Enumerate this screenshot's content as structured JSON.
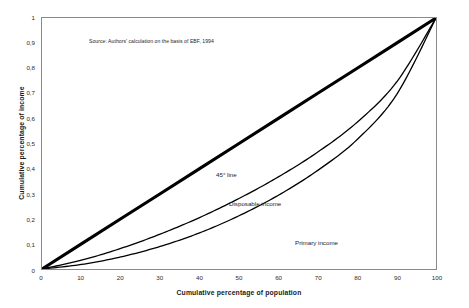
{
  "figure": {
    "source_note": "Source: Authors' calculation on the basis of EBF, 1994"
  },
  "chart_data": {
    "type": "line",
    "title": "",
    "subtitle": "",
    "xlabel": "Cumulative percentage of population",
    "ylabel": "Cumulative percentage of income",
    "xlim": [
      0,
      100
    ],
    "ylim": [
      0,
      1
    ],
    "grid": false,
    "legend_position": "inline-annotations",
    "xticks": [
      "0",
      "10",
      "20",
      "30",
      "40",
      "50",
      "60",
      "70",
      "80",
      "90",
      "100"
    ],
    "xtick_values": [
      0,
      10,
      20,
      30,
      40,
      50,
      60,
      70,
      80,
      90,
      100
    ],
    "yticks": [
      "0",
      "0,1",
      "0,2",
      "0,3",
      "0,4",
      "0,5",
      "0,6",
      "0,7",
      "0,8",
      "0,9",
      "1"
    ],
    "ytick_values": [
      0,
      0.1,
      0.2,
      0.3,
      0.4,
      0.5,
      0.6,
      0.7,
      0.8,
      0.9,
      1
    ],
    "x": [
      0,
      10,
      20,
      30,
      40,
      50,
      60,
      70,
      80,
      90,
      100
    ],
    "series": [
      {
        "name": "45° line",
        "label": "45° line",
        "color": "#000000",
        "linewidth": 3.1,
        "values": [
          0,
          0.1,
          0.2,
          0.3,
          0.4,
          0.5,
          0.6,
          0.7,
          0.8,
          0.9,
          1.0
        ]
      },
      {
        "name": "Disposable income",
        "label": "Disposable income",
        "color": "#000000",
        "linewidth": 1.3,
        "values": [
          0,
          0.035,
          0.082,
          0.139,
          0.205,
          0.281,
          0.367,
          0.466,
          0.585,
          0.745,
          1.0
        ]
      },
      {
        "name": "Primary income",
        "label": "Primary income",
        "color": "#000000",
        "linewidth": 1.3,
        "values": [
          0,
          0.018,
          0.048,
          0.09,
          0.144,
          0.212,
          0.294,
          0.393,
          0.516,
          0.695,
          1.0
        ]
      }
    ],
    "annotations": [
      {
        "text": "45° line",
        "x": 33,
        "y": 0.455
      },
      {
        "text": "Disposable income",
        "x": 36,
        "y": 0.345
      },
      {
        "text": "Primary income",
        "x": 53,
        "y": 0.19
      }
    ]
  }
}
